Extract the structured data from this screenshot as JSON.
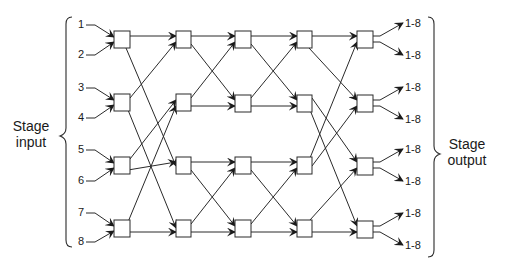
{
  "diagram": {
    "type": "multistage interconnection network (Benes-style, 8x8, 2x2 switches)",
    "labels": {
      "stage_input": [
        "Stage",
        "input"
      ],
      "stage_output": [
        "Stage",
        "output"
      ]
    },
    "inputs": [
      "1",
      "2",
      "3",
      "4",
      "5",
      "6",
      "7",
      "8"
    ],
    "outputs": [
      "1-8",
      "1-8",
      "1-8",
      "1-8",
      "1-8",
      "1-8",
      "1-8",
      "1-8"
    ],
    "stages": 5,
    "switches_per_stage": 4,
    "colors": {
      "line": "#2a2a2a",
      "background": "#ffffff"
    }
  }
}
